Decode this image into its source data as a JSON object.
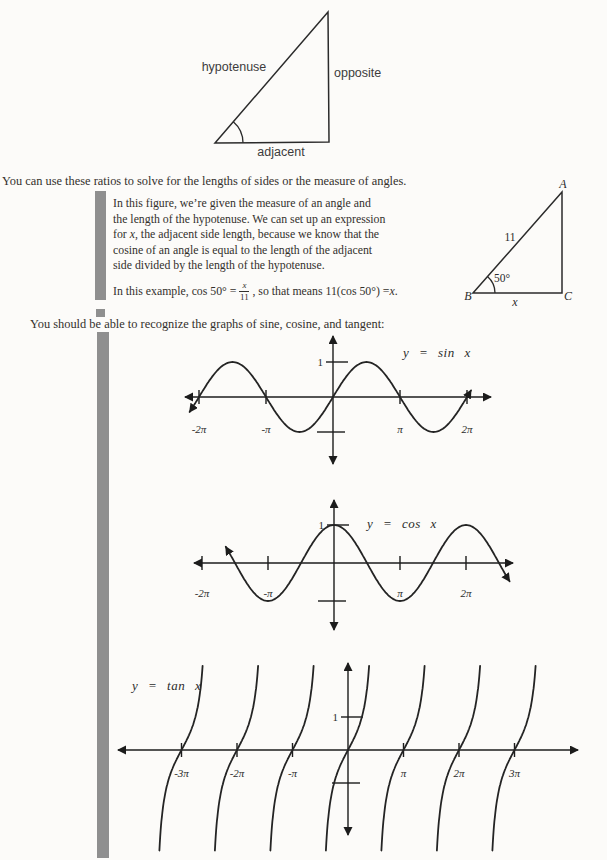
{
  "intro": {
    "line1": "You can use these ratios to solve for the lengths of sides or the measure of angles.",
    "line2": "You should be able to recognize the graphs of sine, cosine, and tangent:"
  },
  "ratio_triangle": {
    "hypotenuse": "hypotenuse",
    "opposite": "opposite",
    "adjacent": "adjacent"
  },
  "example": {
    "line1": "In this figure, we’re given the measure of an angle and",
    "line2": "the length of the hypotenuse. We can set up an expression",
    "line3_pre": "for ",
    "line3_var": "x",
    "line3_post": ", the adjacent side length, because we know that the",
    "line4": "cosine of an angle is equal to the length of the adjacent",
    "line5": "side divided by the length of the hypotenuse.",
    "p2_pre": "In this example, cos 50° = ",
    "frac_num": "x",
    "frac_den": "11",
    "p2_mid": ", so that means 11(cos 50°) = ",
    "p2_var": "x",
    "p2_end": "."
  },
  "example_triangle": {
    "vertex_a": "A",
    "vertex_b": "B",
    "vertex_c": "C",
    "hypotenuse_length": "11",
    "angle": "50°",
    "base_var": "x"
  },
  "chart_data": [
    {
      "id": "sin",
      "type": "line",
      "equation": "y = sin x",
      "function": "y = sin(x)",
      "amplitude": 1,
      "period": "2π",
      "x_range_pi": [
        -2.14,
        2.07
      ],
      "y_range": [
        -1,
        1
      ],
      "y_tick_label": "1",
      "x_ticks": [
        {
          "v": -2,
          "label": "-2π"
        },
        {
          "v": -1,
          "label": "-π"
        },
        {
          "v": 1,
          "label": "π"
        },
        {
          "v": 2,
          "label": "2π"
        }
      ]
    },
    {
      "id": "cos",
      "type": "line",
      "equation": "y = cos x",
      "function": "y = cos(x)",
      "amplitude": 1,
      "period": "2π",
      "x_range_pi": [
        -1.64,
        2.66
      ],
      "y_range": [
        -1,
        1
      ],
      "y_tick_label": "1",
      "x_ticks": [
        {
          "v": -2,
          "label": "-2π"
        },
        {
          "v": -1,
          "label": "-π"
        },
        {
          "v": 1,
          "label": "π"
        },
        {
          "v": 2,
          "label": "2π"
        }
      ]
    },
    {
      "id": "tan",
      "type": "line",
      "equation": "y = tan x",
      "function": "y = tan(x)",
      "period": "π",
      "zero_crossings_pi": [
        -3,
        -2,
        -1,
        0,
        1,
        2,
        3
      ],
      "y_tick_label": "1",
      "x_ticks": [
        {
          "v": -3,
          "label": "-3π"
        },
        {
          "v": -2,
          "label": "-2π"
        },
        {
          "v": -1,
          "label": "-π"
        },
        {
          "v": 1,
          "label": "π"
        },
        {
          "v": 2,
          "label": "2π"
        },
        {
          "v": 3,
          "label": "3π"
        }
      ]
    }
  ]
}
